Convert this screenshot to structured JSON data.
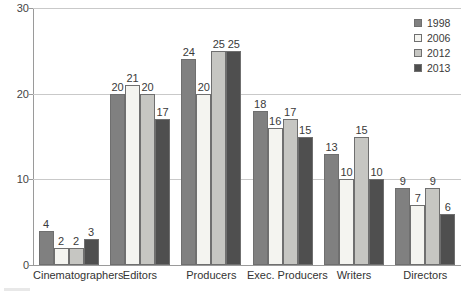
{
  "chart_data": {
    "type": "bar",
    "title": "",
    "subtitle": "",
    "xlabel": "",
    "ylabel": "",
    "ylim": [
      0,
      30
    ],
    "yticks": [
      0,
      10,
      20,
      30
    ],
    "ytick_labels": [
      "0",
      "10",
      "20",
      "30"
    ],
    "grid": true,
    "grid_axis": "y",
    "legend_position": "top-right",
    "categories": [
      "Cinematographers",
      "Editors",
      "Producers",
      "Exec. Producers",
      "Writers",
      "Directors"
    ],
    "series": [
      {
        "name": "1998",
        "color": "#808080",
        "values": [
          4,
          20,
          24,
          18,
          13,
          9
        ]
      },
      {
        "name": "2006",
        "color": "#f4f4f0",
        "values": [
          2,
          21,
          20,
          16,
          10,
          7
        ]
      },
      {
        "name": "2012",
        "color": "#c6c6c2",
        "values": [
          2,
          20,
          25,
          17,
          15,
          9
        ]
      },
      {
        "name": "2013",
        "color": "#4f4f4f",
        "values": [
          3,
          17,
          25,
          15,
          10,
          6
        ]
      }
    ],
    "data_labels": true
  },
  "legend": {
    "items": [
      {
        "label": "1998",
        "swatch": "#808080"
      },
      {
        "label": "2006",
        "swatch": "#f4f4f0"
      },
      {
        "label": "2012",
        "swatch": "#c6c6c2"
      },
      {
        "label": "2013",
        "swatch": "#4f4f4f"
      }
    ]
  }
}
